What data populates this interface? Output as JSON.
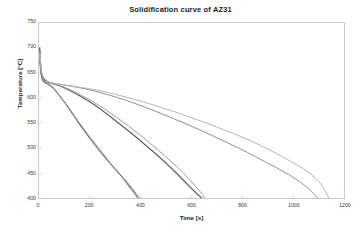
{
  "chart_data": {
    "type": "line",
    "title": "Solidification curve of AZ31",
    "xlabel": "Time [s]",
    "ylabel": "Temperature [°C]",
    "xlim": [
      0,
      1200
    ],
    "ylim": [
      400,
      750
    ],
    "xticks": [
      0,
      200,
      400,
      600,
      800,
      1000,
      1200
    ],
    "xtick_labels": [
      "0",
      "200",
      "400",
      "600",
      "800",
      "1000",
      "1200"
    ],
    "yticks": [
      400,
      450,
      500,
      550,
      600,
      650,
      700,
      750
    ],
    "ytick_labels": [
      "400",
      "450",
      "500",
      "550",
      "600",
      "650",
      "700",
      "750"
    ],
    "grid": false,
    "legend": "none",
    "series": [
      {
        "name": "cooling-curve-fastest",
        "color": "#6e6e6e",
        "width": 1.1,
        "x": [
          0,
          2,
          4,
          6,
          9,
          12,
          16,
          22,
          30,
          42,
          60,
          80,
          105,
          135,
          170,
          205,
          245,
          285,
          325,
          360,
          390
        ],
        "y": [
          690,
          700,
          672,
          655,
          645,
          638,
          634,
          631,
          629,
          626,
          618,
          605,
          588,
          566,
          540,
          516,
          490,
          466,
          443,
          420,
          400
        ]
      },
      {
        "name": "cooling-curve-fastest-duplicate",
        "color": "#8a8a8a",
        "width": 0.9,
        "x": [
          0,
          3,
          6,
          10,
          15,
          22,
          32,
          46,
          65,
          88,
          115,
          148,
          185,
          222,
          262,
          300,
          340,
          375,
          395
        ],
        "y": [
          686,
          696,
          662,
          648,
          638,
          632,
          628,
          624,
          614,
          600,
          582,
          558,
          532,
          508,
          482,
          458,
          436,
          414,
          400
        ]
      },
      {
        "name": "cooling-curve-medium-a",
        "color": "#5f5f5f",
        "width": 1.2,
        "x": [
          0,
          3,
          6,
          10,
          15,
          22,
          32,
          46,
          66,
          92,
          125,
          165,
          210,
          262,
          315,
          370,
          425,
          480,
          530,
          575,
          610,
          640
        ],
        "y": [
          684,
          698,
          666,
          650,
          641,
          636,
          632,
          630,
          627,
          622,
          614,
          603,
          589,
          570,
          549,
          527,
          503,
          479,
          455,
          432,
          414,
          400
        ]
      },
      {
        "name": "cooling-curve-medium-b",
        "color": "#9c9c9c",
        "width": 1.0,
        "x": [
          0,
          3,
          7,
          12,
          18,
          26,
          38,
          55,
          78,
          108,
          145,
          190,
          240,
          295,
          352,
          410,
          466,
          520,
          568,
          608,
          638,
          652
        ],
        "y": [
          680,
          694,
          660,
          646,
          639,
          634,
          631,
          628,
          625,
          620,
          611,
          599,
          584,
          565,
          544,
          521,
          497,
          473,
          450,
          428,
          410,
          400
        ]
      },
      {
        "name": "cooling-curve-slowest-a",
        "color": "#8f8f8f",
        "width": 1.0,
        "x": [
          0,
          4,
          8,
          14,
          22,
          34,
          50,
          75,
          110,
          155,
          210,
          275,
          345,
          420,
          500,
          580,
          660,
          740,
          820,
          895,
          965,
          1030,
          1075,
          1095
        ],
        "y": [
          678,
          692,
          658,
          645,
          638,
          633,
          630,
          628,
          625,
          621,
          615,
          606,
          595,
          581,
          565,
          548,
          530,
          511,
          491,
          471,
          452,
          431,
          412,
          400
        ]
      },
      {
        "name": "cooling-curve-slowest-b",
        "color": "#b4b4b4",
        "width": 1.0,
        "x": [
          0,
          4,
          9,
          16,
          26,
          40,
          60,
          90,
          130,
          180,
          245,
          318,
          398,
          482,
          570,
          658,
          745,
          830,
          912,
          988,
          1058,
          1110,
          1140
        ],
        "y": [
          674,
          688,
          655,
          643,
          637,
          632,
          629,
          627,
          624,
          620,
          614,
          605,
          594,
          581,
          566,
          550,
          533,
          515,
          495,
          474,
          452,
          427,
          400
        ]
      }
    ]
  }
}
